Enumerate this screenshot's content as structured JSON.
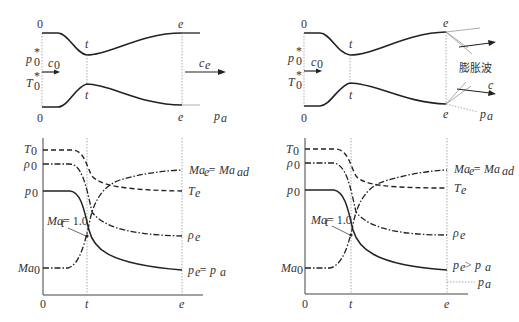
{
  "figure": {
    "left_panel": {
      "nozzle": {
        "station_inlet": "0",
        "station_throat": "t",
        "station_exit": "e",
        "inlet_pressure": "p",
        "inlet_pressure_sub": "0",
        "inlet_pressure_sup": "*",
        "inlet_temperature": "T",
        "inlet_temperature_sub": "0",
        "inlet_temperature_sup": "*",
        "inlet_velocity": "c",
        "inlet_velocity_sub": "0",
        "exit_velocity": "c",
        "exit_velocity_sub": "e",
        "ambient_pressure": "p",
        "ambient_pressure_sub": "a"
      },
      "chart": {
        "y_labels": {
          "T0": "T",
          "T0_sub": "0",
          "rho0": "ρ",
          "rho0_sub": "0",
          "p0": "p",
          "p0_sub": "0",
          "Ma0": "Ma",
          "Ma0_sub": "0"
        },
        "x_labels": [
          "0",
          "t",
          "e"
        ],
        "annotation_throat": "Ma",
        "annotation_throat_sub": "t",
        "annotation_throat_val": " = 1.0",
        "right_labels": {
          "Ma_e": "Ma",
          "Ma_e_sub": "e",
          "Ma_e_eq": " = Ma",
          "Ma_e_eq_sub": "ad",
          "T_e": "T",
          "T_e_sub": "e",
          "rho_e": "ρ",
          "rho_e_sub": "e",
          "p_e": "p",
          "p_e_sub": "e",
          "p_e_rel": " = p",
          "p_e_rel_sub": "a"
        }
      }
    },
    "right_panel": {
      "nozzle": {
        "station_inlet": "0",
        "station_throat": "t",
        "station_exit": "e",
        "inlet_pressure": "p",
        "inlet_pressure_sub": "0",
        "inlet_pressure_sup": "*",
        "inlet_temperature": "T",
        "inlet_temperature_sub": "0",
        "inlet_temperature_sup": "*",
        "inlet_velocity": "c",
        "inlet_velocity_sub": "0",
        "exit_velocity": "c",
        "expansion_wave": "膨胀波",
        "ambient_pressure": "p",
        "ambient_pressure_sub": "a"
      },
      "chart": {
        "y_labels": {
          "T0": "T",
          "T0_sub": "0",
          "rho0": "ρ",
          "rho0_sub": "0",
          "p0": "p",
          "p0_sub": "0",
          "Ma0": "Ma",
          "Ma0_sub": "0"
        },
        "x_labels": [
          "0",
          "t",
          "e"
        ],
        "annotation_throat": "Ma",
        "annotation_throat_sub": "t",
        "annotation_throat_val": " = 1.0",
        "right_labels": {
          "Ma_e": "Ma",
          "Ma_e_sub": "e",
          "Ma_e_eq": " = Ma",
          "Ma_e_eq_sub": "ad",
          "T_e": "T",
          "T_e_sub": "e",
          "rho_e": "ρ",
          "rho_e_sub": "e",
          "p_e": "p",
          "p_e_sub": "e",
          "p_e_rel": " > p",
          "p_e_rel_sub": "a",
          "p_a": "p",
          "p_a_sub": "a"
        }
      }
    },
    "colors": {
      "line": "#222222",
      "guide": "#777777",
      "text": "#333333"
    }
  }
}
